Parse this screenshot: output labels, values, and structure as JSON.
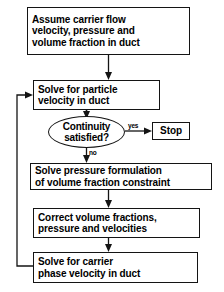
{
  "diagram": {
    "accent_color": "#141414",
    "background_color": "#ffffff"
  },
  "nodes": {
    "assume": {
      "shape": "rectangle",
      "line1": "Assume carrier flow",
      "line2": "velocity, pressure and",
      "line3": "volume fraction in duct"
    },
    "solve_particle": {
      "shape": "rectangle",
      "line1": "Solve for particle",
      "line2": "velocity in duct"
    },
    "continuity": {
      "shape": "ellipse",
      "line1": "Continuity",
      "line2": "satisfied?"
    },
    "stop": {
      "shape": "rectangle",
      "line1": "Stop"
    },
    "solve_pressure": {
      "shape": "rectangle",
      "line1": "Solve pressure formulation",
      "line2": "of volume fraction constraint"
    },
    "correct": {
      "shape": "rectangle",
      "line1": "Correct volume fractions,",
      "line2": "pressure and velocities"
    },
    "solve_carrier": {
      "shape": "rectangle",
      "line1": "Solve for carrier",
      "line2": "phase velocity in duct"
    }
  },
  "edge_labels": {
    "yes": "yes",
    "no": "no"
  }
}
